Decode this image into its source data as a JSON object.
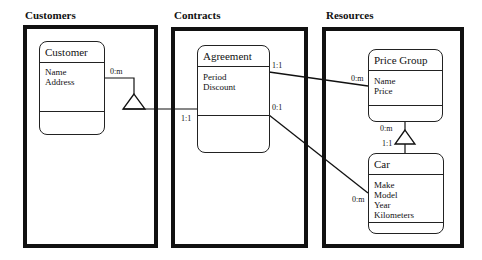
{
  "panels": [
    {
      "title": "Customers"
    },
    {
      "title": "Contracts"
    },
    {
      "title": "Resources"
    }
  ],
  "entities": {
    "customer": {
      "name": "Customer",
      "attributes": [
        "Name",
        "Address"
      ]
    },
    "agreement": {
      "name": "Agreement",
      "attributes": [
        "Period",
        "Discount"
      ]
    },
    "price_group": {
      "name": "Price Group",
      "attributes": [
        "Name",
        "Price"
      ]
    },
    "car": {
      "name": "Car",
      "attributes": [
        "Make",
        "Model",
        "Year",
        "Kilometers"
      ]
    }
  },
  "cardinalities": {
    "customer_side": "0:m",
    "agreement_customer_side": "1:1",
    "agreement_pricegroup_side": "1:1",
    "pricegroup_agreement_side": "0:m",
    "agreement_car_side": "0:1",
    "car_agreement_side": "0:m",
    "pricegroup_car_side": "0:m",
    "car_pricegroup_side": "1:1"
  },
  "colors": {
    "line": "#111111",
    "background": "#ffffff"
  }
}
